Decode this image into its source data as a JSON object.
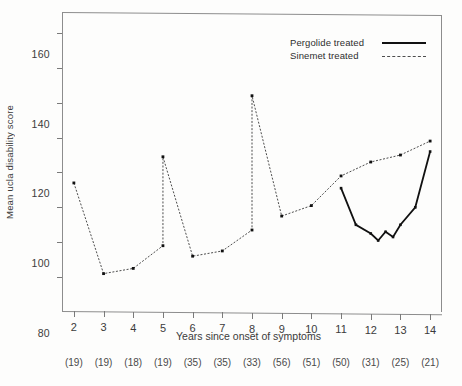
{
  "chart_data": {
    "type": "line",
    "title": "",
    "xlabel": "Years since onset of symptoms",
    "ylabel": "Mean ucla disability score",
    "xlim": [
      1.6,
      14.4
    ],
    "ylim": [
      0,
      172
    ],
    "grid": false,
    "legend_position": "top-right",
    "xticks": [
      2,
      3,
      4,
      5,
      6,
      7,
      8,
      9,
      10,
      11,
      12,
      13,
      14
    ],
    "xtick_labels": [
      "2",
      "3",
      "4",
      "5",
      "6",
      "7",
      "8",
      "9",
      "10",
      "11",
      "12",
      "13",
      "14"
    ],
    "xtick_counts": [
      "(19)",
      "(19)",
      "(18)",
      "(19)",
      "(35)",
      "(35)",
      "(33)",
      "(56)",
      "(51)",
      "(50)",
      "(31)",
      "(25)",
      "(21)"
    ],
    "yticks": [
      20,
      40,
      60,
      80,
      100,
      120,
      140,
      160
    ],
    "ytick_labels": [
      "20",
      "40",
      "60",
      "80",
      "100",
      "120",
      "140",
      "160"
    ],
    "series": [
      {
        "name": "Sinemet treated",
        "style": "dashed",
        "color": "#4d4d4d",
        "x": [
          2,
          3,
          4,
          5,
          5,
          6,
          7,
          8,
          8,
          9,
          10,
          11,
          12,
          13,
          14
        ],
        "y": [
          74,
          22,
          25,
          38,
          89,
          32,
          35,
          47,
          124,
          55,
          61,
          78,
          86,
          90,
          98
        ],
        "points": [
          {
            "x": 2,
            "y": 74
          },
          {
            "x": 3,
            "y": 22
          },
          {
            "x": 4,
            "y": 25
          },
          {
            "x": 5,
            "y": 38
          },
          {
            "x": 5,
            "y": 89
          },
          {
            "x": 6,
            "y": 32
          },
          {
            "x": 7,
            "y": 35
          },
          {
            "x": 8,
            "y": 47
          },
          {
            "x": 8,
            "y": 124
          },
          {
            "x": 9,
            "y": 55
          },
          {
            "x": 10,
            "y": 61
          },
          {
            "x": 11,
            "y": 78
          },
          {
            "x": 12,
            "y": 86
          },
          {
            "x": 13,
            "y": 90
          },
          {
            "x": 14,
            "y": 98
          }
        ]
      },
      {
        "name": "Pergolide treated",
        "style": "solid",
        "color": "#111111",
        "x": [
          11,
          11.5,
          12,
          12.25,
          12.5,
          12.75,
          13,
          13.5,
          14
        ],
        "y": [
          71,
          50,
          45,
          41,
          46,
          43,
          50,
          60,
          92
        ],
        "points": [
          {
            "x": 11,
            "y": 71
          },
          {
            "x": 11.5,
            "y": 50
          },
          {
            "x": 12,
            "y": 45
          },
          {
            "x": 12.25,
            "y": 41
          },
          {
            "x": 12.5,
            "y": 46
          },
          {
            "x": 12.75,
            "y": 43
          },
          {
            "x": 13,
            "y": 50
          },
          {
            "x": 13.5,
            "y": 60
          },
          {
            "x": 14,
            "y": 92
          }
        ]
      }
    ]
  },
  "legend": {
    "items": [
      {
        "label": "Pergolide treated",
        "style": "solid"
      },
      {
        "label": "Sinemet treated",
        "style": "dashed"
      }
    ]
  }
}
